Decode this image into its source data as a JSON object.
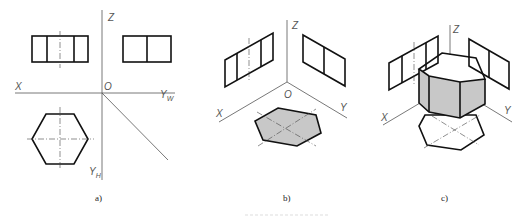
{
  "figure": {
    "panels": [
      {
        "id": "a",
        "caption": "a)",
        "axes": {
          "z": "Z",
          "x": "X",
          "o": "O",
          "yw": "Y",
          "yw_sub": "W",
          "yh": "Y",
          "yh_sub": "H"
        }
      },
      {
        "id": "b",
        "caption": "b)",
        "axes": {
          "z": "Z",
          "x": "X",
          "o": "O",
          "y": "Y"
        }
      },
      {
        "id": "c",
        "caption": "c)",
        "axes": {
          "z": "Z",
          "x": "X",
          "y": "Y"
        }
      }
    ],
    "colors": {
      "line": "#111111",
      "axis": "#555555",
      "shade": "#c8c8c8"
    }
  }
}
